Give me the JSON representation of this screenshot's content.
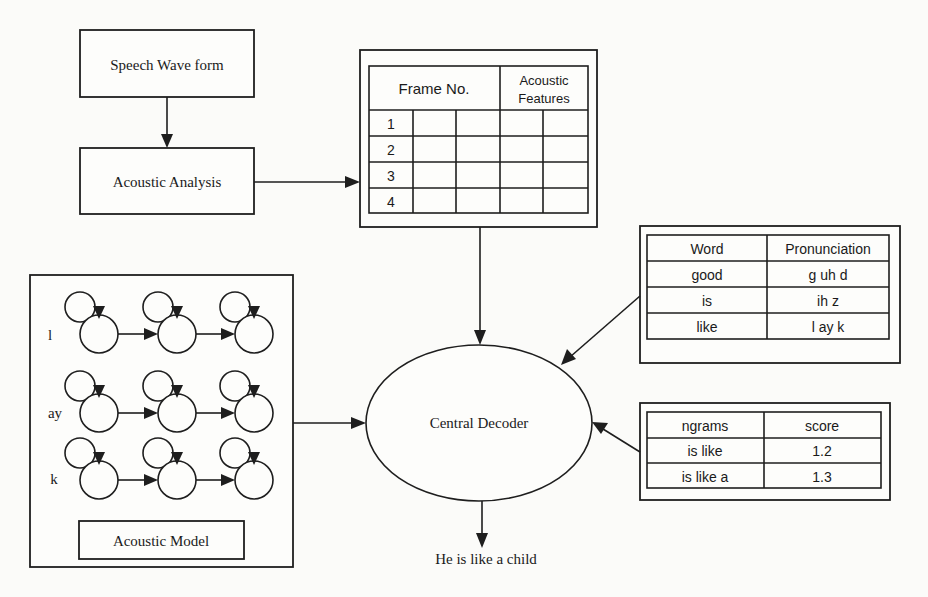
{
  "diagram": {
    "speech_waveform": {
      "label": "Speech Wave form"
    },
    "acoustic_analysis": {
      "label": "Acoustic Analysis"
    },
    "feature_table": {
      "header_frame": "Frame No.",
      "header_features_line1": "Acoustic",
      "header_features_line2": "Features",
      "rows": [
        "1",
        "2",
        "3",
        "4"
      ]
    },
    "lexicon": {
      "headers": [
        "Word",
        "Pronunciation"
      ],
      "rows": [
        [
          "good",
          "g uh d"
        ],
        [
          "is",
          "ih z"
        ],
        [
          "like",
          "l ay k"
        ]
      ]
    },
    "language_model": {
      "headers": [
        "ngrams",
        "score"
      ],
      "rows": [
        [
          "is like",
          "1.2"
        ],
        [
          "is like a",
          "1.3"
        ]
      ]
    },
    "acoustic_model": {
      "label": "Acoustic Model",
      "phones": [
        "l",
        "ay",
        "k"
      ],
      "states_per_phone": 3
    },
    "decoder": {
      "label": "Central Decoder"
    },
    "output": {
      "text": "He is like a child"
    }
  }
}
